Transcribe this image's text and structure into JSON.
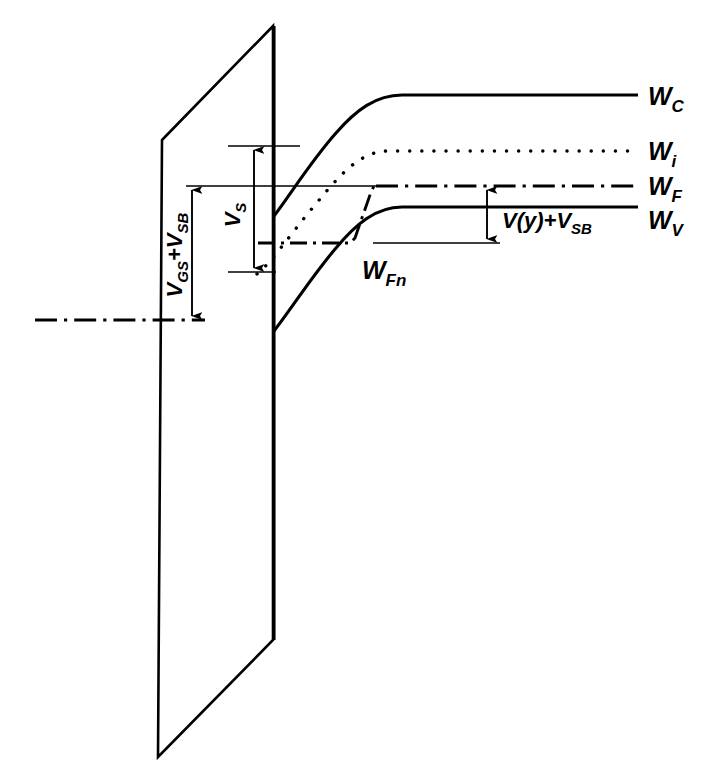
{
  "figure": {
    "background_color": "#ffffff",
    "line_color": "#000000",
    "width": 708,
    "height": 781
  },
  "band_labels": {
    "conduction": {
      "symbol": "W",
      "subscript": "C",
      "full": "WC",
      "y": 95
    },
    "intrinsic": {
      "symbol": "W",
      "subscript": "i",
      "full": "Wi",
      "y": 151
    },
    "fermi": {
      "symbol": "W",
      "subscript": "F",
      "full": "WF",
      "y": 186
    },
    "valence": {
      "symbol": "W",
      "subscript": "V",
      "full": "WV",
      "y": 207
    },
    "quasi_fermi": {
      "symbol": "W",
      "subscript": "Fn",
      "full": "WFn",
      "x": 362,
      "y": 268
    }
  },
  "annotations": {
    "gate_voltage": {
      "text_parts": [
        "V",
        "GS",
        "+V",
        "SB"
      ],
      "full": "VGS+VSB",
      "orientation": "vertical",
      "arrow_x": 192,
      "arrow_top": 186,
      "arrow_bottom": 320
    },
    "surface_potential": {
      "text_parts": [
        "V",
        "S"
      ],
      "full": "VS",
      "orientation": "vertical",
      "arrow_x": 254,
      "arrow_top": 146,
      "arrow_bottom": 272
    },
    "channel_voltage": {
      "text_parts": [
        "V(y)+V",
        "SB"
      ],
      "full": "V(y)+VSB",
      "orientation": "horizontal",
      "arrow_x": 487,
      "arrow_top": 186,
      "arrow_bottom": 243
    }
  },
  "geometry": {
    "oxide_parallelogram": "M162,140 L273,26 L273,640 L158,757 Z",
    "oxide_inner_edge_x": 274,
    "substrate_datum_line": {
      "x1": 35,
      "x2": 205,
      "y": 320
    },
    "band_right_edge": 638,
    "conduction_band_path": "M274,215 C300,185 330,140 360,113 C378,99 390,95 404,95 L638,95",
    "intrinsic_band_path": "M258,273 C285,250 320,200 350,173 C368,157 378,151 392,151 L638,151",
    "fermi_level_path": "M186,186 L638,186",
    "valence_band_path": "M274,330 C300,295 330,250 360,218 C378,208 390,207 404,207 L638,207",
    "quasi_fermi_path": "M258,243 L352,243 L356,240 L372,190 L375,186 L638,186",
    "thin_reference_lines": [
      {
        "name": "vs-top-tick",
        "x1": 228,
        "x2": 300,
        "y": 146
      },
      {
        "name": "fermi-thin-extension",
        "x1": 186,
        "x2": 395,
        "y": 186
      },
      {
        "name": "vs-bottom-tick",
        "x1": 228,
        "x2": 274,
        "y": 272
      },
      {
        "name": "channel-bottom-tick",
        "x1": 373,
        "x2": 500,
        "y": 243
      }
    ]
  },
  "line_styles": {
    "conduction": "solid",
    "intrinsic": "dotted",
    "fermi": "dash-dot",
    "valence": "solid",
    "quasi_fermi": "dash-dot",
    "substrate_datum": "dash-dot"
  }
}
